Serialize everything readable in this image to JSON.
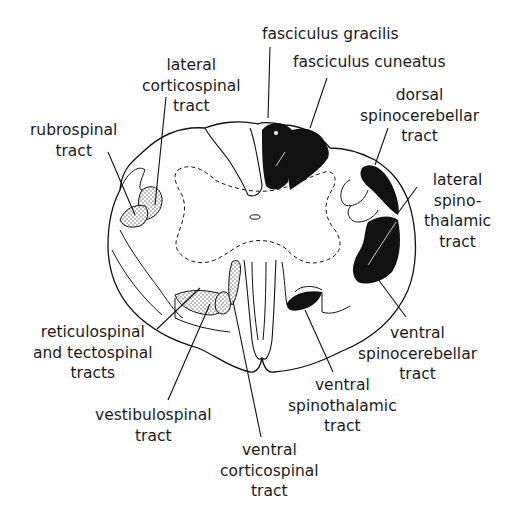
{
  "figure": {
    "colors": {
      "ink": "#111111",
      "background": "#ffffff",
      "stipple": "#555555"
    }
  },
  "labels": {
    "fasciculus_gracilis": {
      "lines": [
        "fasciculus gracilis"
      ]
    },
    "fasciculus_cuneatus": {
      "lines": [
        "fasciculus cuneatus"
      ]
    },
    "dorsal_spinocerebellar": {
      "lines": [
        "dorsal",
        "spinocerebellar",
        "tract"
      ]
    },
    "lateral_spinothalamic": {
      "lines": [
        "lateral",
        "spino-",
        "thalamic",
        "tract"
      ]
    },
    "lateral_corticospinal": {
      "lines": [
        "lateral",
        "corticospinal",
        "tract"
      ]
    },
    "rubrospinal": {
      "lines": [
        "rubrospinal",
        "tract"
      ]
    },
    "reticulospinal_tectospinal": {
      "lines": [
        "reticulospinal",
        "and tectospinal",
        "tracts"
      ]
    },
    "vestibulospinal": {
      "lines": [
        "vestibulospinal",
        "tract"
      ]
    },
    "ventral_corticospinal": {
      "lines": [
        "ventral",
        "corticospinal",
        "tract"
      ]
    },
    "ventral_spinothalamic": {
      "lines": [
        "ventral",
        "spinothalamic",
        "tract"
      ]
    },
    "ventral_spinocerebellar": {
      "lines": [
        "ventral",
        "spinocerebellar",
        "tract"
      ]
    }
  }
}
